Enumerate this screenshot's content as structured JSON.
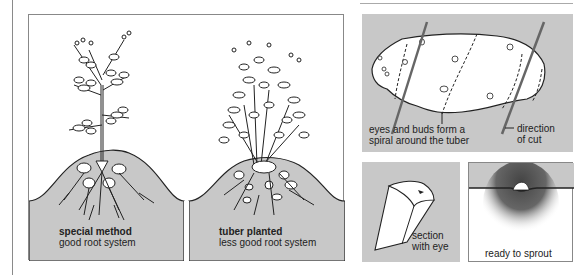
{
  "panels": {
    "special_method": {
      "title": "special method",
      "subtitle": "good root system"
    },
    "tuber_planted": {
      "title": "tuber planted",
      "subtitle": "less good root system"
    },
    "tuber_diagram": {
      "annotation_left_line1": "eyes and buds form a",
      "annotation_left_line2": "spiral around the tuber",
      "annotation_right_line1": "direction",
      "annotation_right_line2": "of cut"
    },
    "section": {
      "label_line1": "section",
      "label_line2": "with eye"
    },
    "sprout": {
      "label": "ready to sprout"
    }
  },
  "colors": {
    "soil": "#c8c8c8",
    "outline": "#222222",
    "cut_line": "#666666",
    "background": "#ffffff"
  }
}
